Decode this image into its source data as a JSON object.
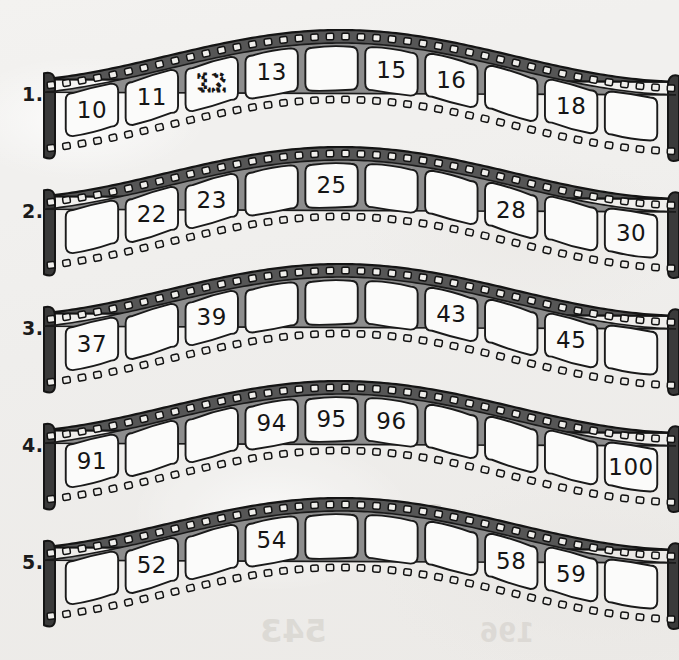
{
  "worksheet": {
    "background_color": "#f1f0ee",
    "ink_color": "#151515",
    "film_band_color": "#4a4a4a",
    "frame_fill": "#fbfbfa",
    "frames_per_row": 10,
    "ghost_marks": [
      "2839",
      "5930",
      "543",
      "196",
      "2839"
    ]
  },
  "rows": [
    {
      "label": "1.",
      "sequence_start": 10,
      "frames": [
        {
          "value": "10",
          "filled": true,
          "style": "solid"
        },
        {
          "value": "11",
          "filled": true,
          "style": "solid"
        },
        {
          "value": "12",
          "filled": true,
          "style": "traced"
        },
        {
          "value": "13",
          "filled": true,
          "style": "solid"
        },
        {
          "value": "",
          "filled": false,
          "style": "blank"
        },
        {
          "value": "15",
          "filled": true,
          "style": "solid"
        },
        {
          "value": "16",
          "filled": true,
          "style": "solid"
        },
        {
          "value": "",
          "filled": false,
          "style": "blank"
        },
        {
          "value": "18",
          "filled": true,
          "style": "solid"
        },
        {
          "value": "",
          "filled": false,
          "style": "blank"
        }
      ]
    },
    {
      "label": "2.",
      "sequence_start": 21,
      "frames": [
        {
          "value": "",
          "filled": false,
          "style": "blank"
        },
        {
          "value": "22",
          "filled": true,
          "style": "solid"
        },
        {
          "value": "23",
          "filled": true,
          "style": "solid"
        },
        {
          "value": "",
          "filled": false,
          "style": "blank"
        },
        {
          "value": "25",
          "filled": true,
          "style": "solid"
        },
        {
          "value": "",
          "filled": false,
          "style": "blank"
        },
        {
          "value": "",
          "filled": false,
          "style": "blank"
        },
        {
          "value": "28",
          "filled": true,
          "style": "solid"
        },
        {
          "value": "",
          "filled": false,
          "style": "blank"
        },
        {
          "value": "30",
          "filled": true,
          "style": "solid"
        }
      ]
    },
    {
      "label": "3.",
      "sequence_start": 37,
      "frames": [
        {
          "value": "37",
          "filled": true,
          "style": "solid"
        },
        {
          "value": "",
          "filled": false,
          "style": "blank"
        },
        {
          "value": "39",
          "filled": true,
          "style": "solid"
        },
        {
          "value": "",
          "filled": false,
          "style": "blank"
        },
        {
          "value": "",
          "filled": false,
          "style": "blank"
        },
        {
          "value": "",
          "filled": false,
          "style": "blank"
        },
        {
          "value": "43",
          "filled": true,
          "style": "solid"
        },
        {
          "value": "",
          "filled": false,
          "style": "blank"
        },
        {
          "value": "45",
          "filled": true,
          "style": "solid"
        },
        {
          "value": "",
          "filled": false,
          "style": "blank"
        }
      ]
    },
    {
      "label": "4.",
      "sequence_start": 91,
      "frames": [
        {
          "value": "91",
          "filled": true,
          "style": "solid"
        },
        {
          "value": "",
          "filled": false,
          "style": "blank"
        },
        {
          "value": "",
          "filled": false,
          "style": "blank"
        },
        {
          "value": "94",
          "filled": true,
          "style": "solid"
        },
        {
          "value": "95",
          "filled": true,
          "style": "solid"
        },
        {
          "value": "96",
          "filled": true,
          "style": "solid"
        },
        {
          "value": "",
          "filled": false,
          "style": "blank"
        },
        {
          "value": "",
          "filled": false,
          "style": "blank"
        },
        {
          "value": "",
          "filled": false,
          "style": "blank"
        },
        {
          "value": "100",
          "filled": true,
          "style": "solid"
        }
      ]
    },
    {
      "label": "5.",
      "sequence_start": 51,
      "frames": [
        {
          "value": "",
          "filled": false,
          "style": "blank"
        },
        {
          "value": "52",
          "filled": true,
          "style": "solid"
        },
        {
          "value": "",
          "filled": false,
          "style": "blank"
        },
        {
          "value": "54",
          "filled": true,
          "style": "solid"
        },
        {
          "value": "",
          "filled": false,
          "style": "blank"
        },
        {
          "value": "",
          "filled": false,
          "style": "blank"
        },
        {
          "value": "",
          "filled": false,
          "style": "blank"
        },
        {
          "value": "58",
          "filled": true,
          "style": "solid"
        },
        {
          "value": "59",
          "filled": true,
          "style": "solid"
        },
        {
          "value": "",
          "filled": false,
          "style": "blank"
        }
      ]
    }
  ]
}
